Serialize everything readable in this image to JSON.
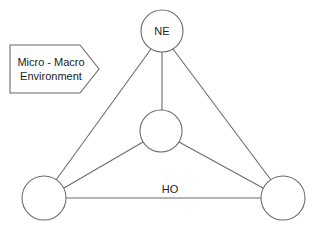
{
  "diagram": {
    "type": "network",
    "colors": {
      "stroke": "#6b6b6b",
      "fill": "#ffffff",
      "text": "#222222",
      "background": "#ffffff"
    },
    "callout": {
      "shape": "pentagon-arrow",
      "line1": "Micro - Macro",
      "line2": "Environment"
    },
    "nodes": [
      {
        "id": "top",
        "label": "NE",
        "cx": 162,
        "cy": 31,
        "r": 21
      },
      {
        "id": "center",
        "label": "",
        "cx": 161,
        "cy": 131,
        "r": 21
      },
      {
        "id": "bottom-left",
        "label": "",
        "cx": 44,
        "cy": 198,
        "r": 22
      },
      {
        "id": "bottom-right",
        "label": "",
        "cx": 283,
        "cy": 198,
        "r": 22
      }
    ],
    "edges": [
      {
        "from": "top",
        "to": "bottom-left",
        "label": ""
      },
      {
        "from": "top",
        "to": "bottom-right",
        "label": ""
      },
      {
        "from": "top",
        "to": "center",
        "label": ""
      },
      {
        "from": "center",
        "to": "bottom-left",
        "label": ""
      },
      {
        "from": "center",
        "to": "bottom-right",
        "label": ""
      },
      {
        "from": "bottom-left",
        "to": "bottom-right",
        "label": "HO"
      }
    ]
  }
}
